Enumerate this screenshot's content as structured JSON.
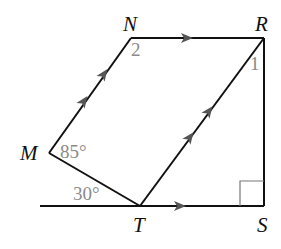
{
  "diagram": {
    "type": "geometry",
    "points": {
      "N": {
        "label": "N"
      },
      "R": {
        "label": "R"
      },
      "M": {
        "label": "M"
      },
      "T": {
        "label": "T"
      },
      "S": {
        "label": "S"
      }
    },
    "angles": {
      "M": "85°",
      "T_left": "30°",
      "N": "2",
      "R": "1"
    },
    "segments": [
      "MN",
      "NR",
      "RS",
      "TR",
      "MT",
      "line through T and S"
    ],
    "parallel_marks": {
      "single_arrow": [
        "NR",
        "TS"
      ],
      "double_arrow": [
        "MN",
        "TR"
      ]
    },
    "right_angle_at": "S",
    "colors": {
      "line": "#111111",
      "label": "#111111",
      "angle_label": "#8a8a8a"
    }
  }
}
